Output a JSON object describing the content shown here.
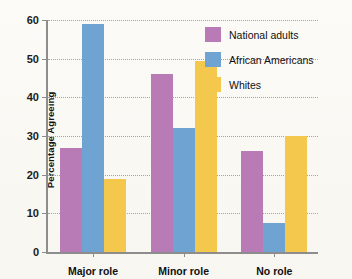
{
  "chart_data": {
    "type": "bar",
    "title": "",
    "xlabel": "",
    "ylabel": "Percentage Agreeing",
    "ylim": [
      0,
      60
    ],
    "ytick_labels": [
      "0",
      "10",
      "20",
      "30",
      "40",
      "50",
      "60"
    ],
    "ytick_values": [
      0,
      10,
      20,
      30,
      40,
      50,
      60
    ],
    "grid": true,
    "legend_position": "upper right",
    "categories": [
      "Major role",
      "Minor role",
      "No role"
    ],
    "series": [
      {
        "name": "National adults",
        "color": "#b87bb5",
        "values": [
          27,
          46,
          26
        ]
      },
      {
        "name": "African Americans",
        "color": "#6fa3d2",
        "values": [
          59,
          32,
          7.5
        ]
      },
      {
        "name": "Whites",
        "color": "#f3c84c",
        "values": [
          19,
          49.5,
          30
        ]
      }
    ]
  }
}
